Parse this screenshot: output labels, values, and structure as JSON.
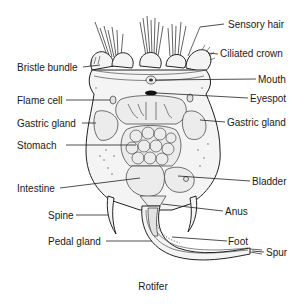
{
  "diagram": {
    "title": "Rotifer",
    "labels": {
      "sensory_hair": "Sensory hair",
      "ciliated_crown": "Ciliated crown",
      "bristle_bundle": "Bristle bundle",
      "mouth": "Mouth",
      "eyespot": "Eyespot",
      "flame_cell": "Flame cell",
      "gastric_gland_left": "Gastric gland",
      "gastric_gland_right": "Gastric gland",
      "stomach": "Stomach",
      "intestine": "Intestine",
      "bladder": "Bladder",
      "anus": "Anus",
      "spine": "Spine",
      "foot": "Foot",
      "pedal_gland": "Pedal gland",
      "spur": "Spur"
    },
    "colors": {
      "ink": "#1a1a1a",
      "background": "#ffffff",
      "body_fill": "#f4f4f4"
    }
  }
}
